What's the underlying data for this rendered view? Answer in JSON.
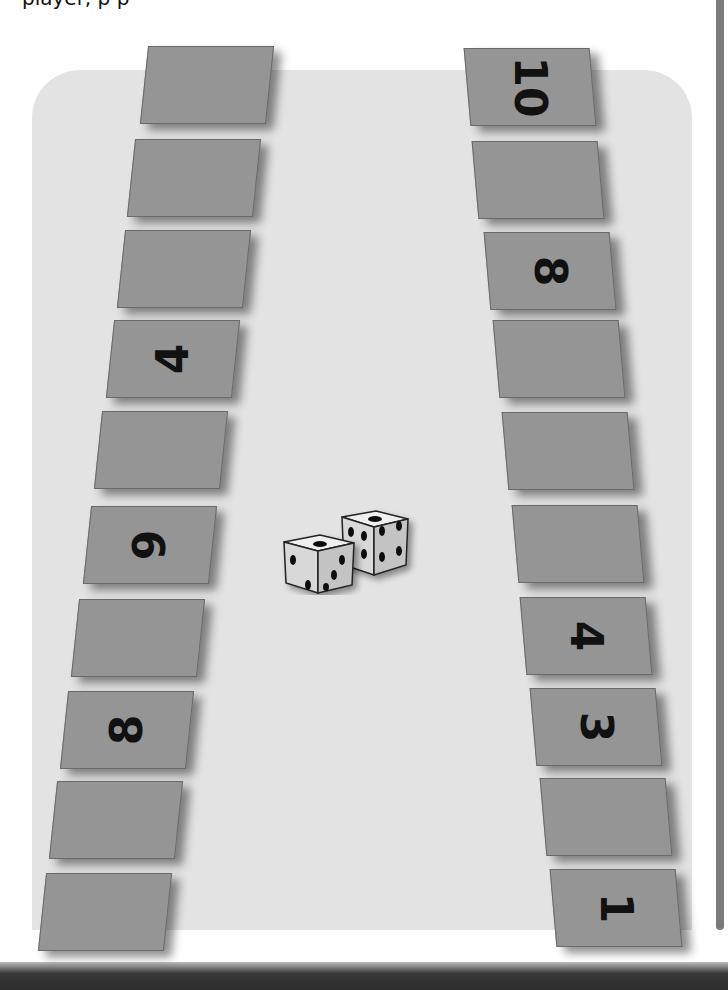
{
  "header": {
    "clipped_text": "player, p   p"
  },
  "board": {
    "background": "#e3e3e3",
    "card_color": "#959595"
  },
  "left_track": {
    "cards": [
      {
        "label": ""
      },
      {
        "label": ""
      },
      {
        "label": ""
      },
      {
        "label": "4"
      },
      {
        "label": ""
      },
      {
        "label": "9"
      },
      {
        "label": ""
      },
      {
        "label": "8"
      },
      {
        "label": ""
      },
      {
        "label": ""
      }
    ]
  },
  "right_track": {
    "cards": [
      {
        "label": "10"
      },
      {
        "label": ""
      },
      {
        "label": "8"
      },
      {
        "label": ""
      },
      {
        "label": ""
      },
      {
        "label": ""
      },
      {
        "label": "4"
      },
      {
        "label": "3"
      },
      {
        "label": ""
      },
      {
        "label": "1"
      }
    ]
  },
  "dice": {
    "die1_top": 1,
    "die1_front": 3,
    "die1_side": 2,
    "die2_top": 1,
    "die2_front": 6,
    "die2_side": 4
  }
}
